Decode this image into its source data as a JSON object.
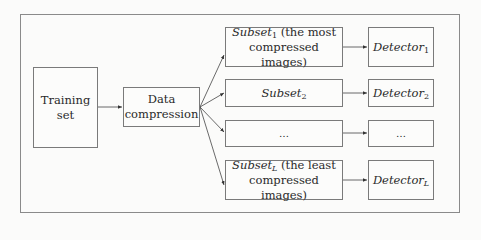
{
  "diagram": {
    "nodes": {
      "training_set": {
        "line1": "Training",
        "line2": "set"
      },
      "data_compression": {
        "line1": "Data",
        "line2": "compression"
      },
      "subsets": [
        {
          "name": "Subset",
          "sub": "1",
          "suffix": " (the most",
          "line2": "compressed images)"
        },
        {
          "name": "Subset",
          "sub": "2",
          "suffix": "",
          "line2": ""
        },
        {
          "name": "…",
          "sub": "",
          "suffix": "",
          "line2": ""
        },
        {
          "name": "Subset",
          "sub": "L",
          "suffix": " (the least",
          "line2": "compressed images)"
        }
      ],
      "detectors": [
        {
          "name": "Detector",
          "sub": "1"
        },
        {
          "name": "Detector",
          "sub": "2"
        },
        {
          "name": "…",
          "sub": ""
        },
        {
          "name": "Detector",
          "sub": "L"
        }
      ]
    },
    "edges": [
      [
        "training_set",
        "data_compression"
      ],
      [
        "data_compression",
        "subset_1"
      ],
      [
        "data_compression",
        "subset_2"
      ],
      [
        "data_compression",
        "subset_dots"
      ],
      [
        "data_compression",
        "subset_L"
      ],
      [
        "subset_1",
        "detector_1"
      ],
      [
        "subset_2",
        "detector_2"
      ],
      [
        "subset_dots",
        "detector_dots"
      ],
      [
        "subset_L",
        "detector_L"
      ]
    ]
  }
}
